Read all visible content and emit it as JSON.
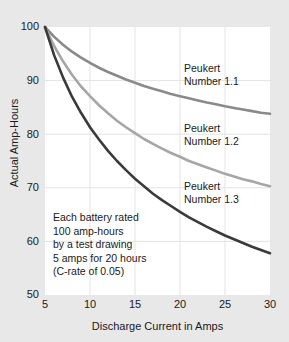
{
  "chart_data": {
    "type": "line",
    "title": "",
    "xlabel": "Discharge Current in Amps",
    "ylabel": "Actual Amp-Hours",
    "xlim": [
      5,
      30
    ],
    "ylim": [
      50,
      100
    ],
    "xticks": [
      "5",
      "10",
      "15",
      "20",
      "25",
      "30"
    ],
    "yticks": [
      "50",
      "60",
      "70",
      "80",
      "90",
      "100"
    ],
    "grid": true,
    "legend_position": "inline-annotations",
    "x": [
      5,
      6,
      7,
      8,
      9,
      10,
      11,
      12,
      13,
      14,
      15,
      16,
      17,
      18,
      19,
      20,
      21,
      22,
      23,
      24,
      25,
      26,
      27,
      28,
      29,
      30
    ],
    "series": [
      {
        "name": "Peukert Number 1.1",
        "peukert_number": 1.1,
        "color": "#8a8a8a",
        "values": [
          100.0,
          98.2,
          96.7,
          95.4,
          94.3,
          93.3,
          92.4,
          91.6,
          90.9,
          90.2,
          89.6,
          89.0,
          88.5,
          88.0,
          87.5,
          87.1,
          86.7,
          86.3,
          85.9,
          85.6,
          85.2,
          84.9,
          84.6,
          84.3,
          84.0,
          83.8
        ]
      },
      {
        "name": "Peukert Number 1.2",
        "peukert_number": 1.2,
        "color": "#a6a6a6",
        "values": [
          100.0,
          96.5,
          93.6,
          91.1,
          88.9,
          87.1,
          85.4,
          83.9,
          82.5,
          81.3,
          80.2,
          79.1,
          78.2,
          77.3,
          76.5,
          75.8,
          75.0,
          74.4,
          73.8,
          73.2,
          72.6,
          72.1,
          71.6,
          71.2,
          70.7,
          70.3
        ]
      },
      {
        "name": "Peukert Number 1.3",
        "peukert_number": 1.3,
        "color": "#3a3a3a",
        "values": [
          100.0,
          94.8,
          90.6,
          87.0,
          84.0,
          81.3,
          79.0,
          76.9,
          75.0,
          73.3,
          71.7,
          70.3,
          68.9,
          67.7,
          66.6,
          65.5,
          64.5,
          63.6,
          62.7,
          61.9,
          61.1,
          60.4,
          59.7,
          59.0,
          58.4,
          57.8
        ]
      }
    ],
    "annotations": [
      {
        "id": "ann-11",
        "line1": "Peukert",
        "line2": "Number 1.1"
      },
      {
        "id": "ann-12",
        "line1": "Peukert",
        "line2": "Number 1.2"
      },
      {
        "id": "ann-13",
        "line1": "Peukert",
        "line2": "Number 1.3"
      }
    ],
    "note": {
      "line1": "Each battery rated",
      "line2": "100 amp-hours",
      "line3": "by a test drawing",
      "line4": "5 amps for 20 hours",
      "line5": "(C-rate of 0.05)"
    }
  },
  "axes": {
    "y": {
      "t0": "100",
      "t1": "90",
      "t2": "80",
      "t3": "70",
      "t4": "60",
      "t5": "50",
      "label": "Actual Amp-Hours"
    },
    "x": {
      "t0": "5",
      "t1": "10",
      "t2": "15",
      "t3": "20",
      "t4": "25",
      "t5": "30",
      "label": "Discharge Current in Amps"
    }
  },
  "colors": {
    "background": "#e8e8e8",
    "plot_background": "#ffffff",
    "grid": "#e0e0e0",
    "text": "#1a1a1a",
    "curve_11": "#8a8a8a",
    "curve_12": "#a6a6a6",
    "curve_13": "#3a3a3a"
  }
}
